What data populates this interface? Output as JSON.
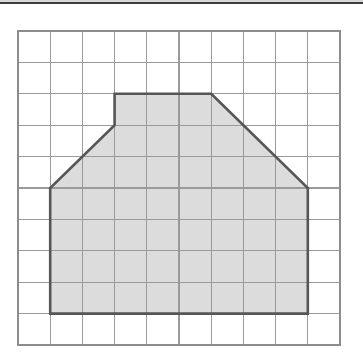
{
  "figure": {
    "background_color": "#ffffff"
  },
  "grid": {
    "columns": 10,
    "rows": 10,
    "origin_x": 18,
    "origin_y": 31,
    "cell_width": 32.2,
    "cell_height": 31.4,
    "line_color": "#8d8d8d",
    "frame_color": "#8d8d8d",
    "line_width": 1.25,
    "show_grid": true
  },
  "shape": {
    "name": "shaded-polygon",
    "type": "polygon",
    "fill_color": "#dcdcdc",
    "outline_color": "#565656",
    "outline_width": 2.6,
    "vertices_grid": [
      [
        3,
        2
      ],
      [
        6,
        2
      ],
      [
        9,
        5
      ],
      [
        9,
        9
      ],
      [
        1,
        9
      ],
      [
        1,
        5
      ],
      [
        3,
        3
      ]
    ],
    "vertex_count": 7,
    "area_cells": 48
  },
  "artifacts": {
    "top_band_color": "#2e2e2e",
    "top_band_height": 2
  },
  "chart_data": {
    "type": "scatter",
    "xlabel": "",
    "ylabel": "",
    "xlim": [
      0,
      10
    ],
    "ylim": [
      0,
      10
    ],
    "grid": true,
    "legend": "none",
    "categories": [
      "polygon-vertex"
    ],
    "x": [
      3,
      6,
      9,
      9,
      1,
      1,
      3
    ],
    "y": [
      2,
      2,
      5,
      9,
      9,
      5,
      3
    ],
    "series": [
      {
        "name": "shaded-polygon-outline",
        "points": [
          [
            3,
            2
          ],
          [
            6,
            2
          ],
          [
            9,
            5
          ],
          [
            9,
            9
          ],
          [
            1,
            9
          ],
          [
            1,
            5
          ],
          [
            3,
            3
          ],
          [
            3,
            2
          ]
        ]
      }
    ],
    "annotations": []
  }
}
